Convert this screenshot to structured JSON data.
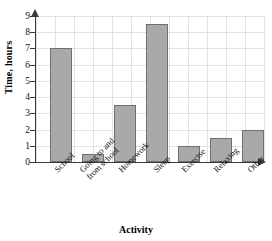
{
  "chart_data": {
    "type": "bar",
    "title": "",
    "xlabel": "Activity",
    "ylabel": "Time, hours",
    "categories": [
      "School",
      "Going to and\nfrom school",
      "Homework",
      "Sleep",
      "Exercise",
      "Relaxing",
      "Other"
    ],
    "values": [
      7,
      0.5,
      3.5,
      8.5,
      1,
      1.5,
      2
    ],
    "ylim": [
      0,
      9
    ],
    "yticks": [
      0,
      1,
      2,
      3,
      4,
      5,
      6,
      7,
      8,
      9
    ],
    "ytick_labels": [
      "0",
      "1",
      "2",
      "3",
      "4",
      "5",
      "6",
      "7",
      "8",
      "9"
    ],
    "grid": true,
    "legend": false,
    "bar_color": "#a9a9a9",
    "bar_edge_color": "#6f6f6f",
    "grid_color": "#e2e2e2",
    "axis_color": "#3a3a3a"
  },
  "axes": {
    "y_title": "Time, hours",
    "x_title": "Activity"
  },
  "ticks": {
    "y": [
      "9",
      "8",
      "7",
      "6",
      "5",
      "4",
      "3",
      "2",
      "1",
      "0"
    ]
  },
  "categories": {
    "c0": "School",
    "c1_line1": "Going to and",
    "c1_line2": "from school",
    "c2": "Homework",
    "c3": "Sleep",
    "c4": "Exercise",
    "c5": "Relaxing",
    "c6": "Other"
  }
}
